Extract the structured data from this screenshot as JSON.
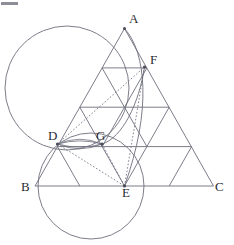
{
  "figure": {
    "canvas": {
      "width": 234,
      "height": 245
    },
    "colors": {
      "line": "#6e6e7d",
      "label": "#2b2b33",
      "vertex": "#4a4a58",
      "background": "#ffffff",
      "corner_mark": "#8d8d98"
    },
    "labels": [
      {
        "id": "A",
        "text": "A",
        "x": 129,
        "y": 23,
        "point_x": 124.5,
        "point_y": 28.5
      },
      {
        "id": "F",
        "text": "F",
        "x": 150,
        "y": 64,
        "point_x": 144.5,
        "point_y": 67.0
      },
      {
        "id": "D",
        "text": "D",
        "x": 48,
        "y": 140,
        "point_x": 57.5,
        "point_y": 144.0
      },
      {
        "id": "G",
        "text": "G",
        "x": 96,
        "y": 140,
        "point_x": 102.0,
        "point_y": 144.0
      },
      {
        "id": "B",
        "text": "B",
        "x": 21,
        "y": 191,
        "point_x": 35.0,
        "point_y": 186.0
      },
      {
        "id": "E",
        "text": "E",
        "x": 122,
        "y": 196,
        "point_x": 124.5,
        "point_y": 186.0
      },
      {
        "id": "C",
        "text": "C",
        "x": 215,
        "y": 191,
        "point_x": 213.5,
        "point_y": 186.0
      }
    ],
    "triangle": {
      "vertex_a": {
        "x": 124.5,
        "y": 28.5
      },
      "vertex_b": {
        "x": 35.0,
        "y": 186.0
      },
      "vertex_c": {
        "x": 213.5,
        "y": 186.0
      },
      "subdivisions": 4
    },
    "marked_points": [
      {
        "id": "A",
        "x": 124.5,
        "y": 28.5
      },
      {
        "id": "F",
        "x": 144.5,
        "y": 67.0
      },
      {
        "id": "D",
        "x": 57.5,
        "y": 144.0
      },
      {
        "id": "G",
        "x": 102.0,
        "y": 144.0
      },
      {
        "id": "E",
        "x": 124.5,
        "y": 186.0
      }
    ],
    "circles": [
      {
        "id": "large-circle-AD",
        "cx": 67.0,
        "cy": 88.0,
        "r": 62.0,
        "note": "passes through A and D"
      },
      {
        "id": "lower-circle-DGE",
        "cx": 91.0,
        "cy": 186.0,
        "r": 53.0,
        "note": "passes through D, G and E"
      }
    ],
    "arcs": [
      {
        "id": "arc-A-F-E",
        "d": "M 124.5 28.5 C 146 52 152 110 124.5 186",
        "note": "arc from A through F down to E"
      },
      {
        "id": "arc-G-F",
        "d": "M 102 144 C 122 138 139 104 144.5 67",
        "note": "arc from G up to F"
      }
    ],
    "lens_arcs": [
      {
        "id": "lens-upper-DG",
        "d": "M 57.5 144 Q 80 134.5 102 144"
      },
      {
        "id": "lens-lower-DG",
        "d": "M 57.5 144 Q 80 153.5 102 144"
      },
      {
        "id": "lens-upper2-DG",
        "d": "M 57.5 144 Q 80 137.5 102 144"
      },
      {
        "id": "lens-lower2-DG",
        "d": "M 57.5 144 Q 80 150.5 102 144"
      }
    ],
    "dotted_segments": [
      {
        "id": "dotted-D-F",
        "x1": 57.5,
        "y1": 144.0,
        "x2": 144.5,
        "y2": 67.0
      },
      {
        "id": "dotted-D-E",
        "x1": 57.5,
        "y1": 144.0,
        "x2": 124.5,
        "y2": 186.0
      },
      {
        "id": "dotted-F-E",
        "x1": 144.5,
        "y1": 67.0,
        "x2": 124.5,
        "y2": 186.0
      },
      {
        "id": "dotted-G-E",
        "x1": 102.0,
        "y1": 144.0,
        "x2": 124.5,
        "y2": 186.0
      }
    ],
    "solid_segments": [
      {
        "id": "side-AB",
        "x1": 124.5,
        "y1": 28.5,
        "x2": 35.0,
        "y2": 186.0
      },
      {
        "id": "side-AC",
        "x1": 124.5,
        "y1": 28.5,
        "x2": 213.5,
        "y2": 186.0
      },
      {
        "id": "side-BC",
        "x1": 35.0,
        "y1": 186.0,
        "x2": 213.5,
        "y2": 186.0
      },
      {
        "id": "row1-horizontal",
        "x1": 102.1,
        "y1": 67.9,
        "x2": 146.9,
        "y2": 67.9
      },
      {
        "id": "row2-horizontal",
        "x1": 79.8,
        "y1": 107.2,
        "x2": 169.2,
        "y2": 107.2
      },
      {
        "id": "row3-horizontal",
        "x1": 57.4,
        "y1": 146.6,
        "x2": 191.6,
        "y2": 146.6
      },
      {
        "id": "left-diag-1",
        "x1": 102.1,
        "y1": 67.9,
        "x2": 146.9,
        "y2": 146.6
      },
      {
        "id": "left-diag-2",
        "x1": 79.8,
        "y1": 107.2,
        "x2": 124.5,
        "y2": 186.0
      },
      {
        "id": "left-diag-3",
        "x1": 57.4,
        "y1": 146.6,
        "x2": 79.8,
        "y2": 186.0
      },
      {
        "id": "right-diag-1",
        "x1": 146.9,
        "y1": 67.9,
        "x2": 102.1,
        "y2": 146.6
      },
      {
        "id": "right-diag-2",
        "x1": 169.2,
        "y1": 107.2,
        "x2": 124.5,
        "y2": 186.0
      },
      {
        "id": "right-diag-3",
        "x1": 191.6,
        "y1": 146.6,
        "x2": 169.2,
        "y2": 186.0
      },
      {
        "id": "extra-D-B-diag",
        "x1": 57.4,
        "y1": 146.6,
        "x2": 35.0,
        "y2": 186.0
      }
    ]
  }
}
